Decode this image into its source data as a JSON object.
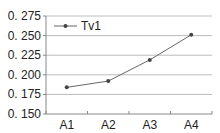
{
  "chart_data": {
    "type": "line",
    "title": "",
    "xlabel": "",
    "ylabel": "",
    "categories": [
      "A1",
      "A2",
      "A3",
      "A4"
    ],
    "series": [
      {
        "name": "Tv1",
        "values": [
          0.184,
          0.192,
          0.219,
          0.251
        ]
      }
    ],
    "ylim": [
      0.15,
      0.275
    ],
    "yticks": [
      0.15,
      0.175,
      0.2,
      0.225,
      0.25,
      0.275
    ],
    "ytick_labels": [
      "0. 150",
      "0. 175",
      "0. 200",
      "0. 225",
      "0. 250",
      "0. 275"
    ],
    "grid": true,
    "legend": "top-left",
    "colors": {
      "line": "#666666",
      "marker": "#444444",
      "grid": "#bbbbbb",
      "axis": "#888888"
    }
  }
}
